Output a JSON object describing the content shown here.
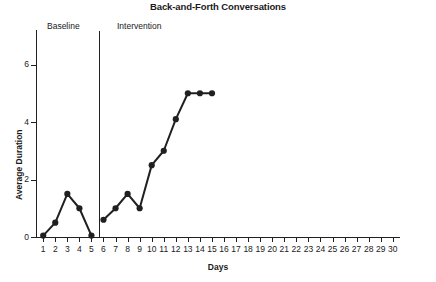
{
  "chart_data": {
    "type": "line",
    "title": "Back-and-Forth Conversations",
    "xlabel": "Days",
    "ylabel": "Average Duration",
    "xlim": [
      0.4,
      30.6
    ],
    "ylim": [
      0,
      7.2
    ],
    "x_ticks": [
      1,
      2,
      3,
      4,
      5,
      6,
      7,
      8,
      9,
      10,
      11,
      12,
      13,
      14,
      15,
      16,
      17,
      18,
      19,
      20,
      21,
      22,
      23,
      24,
      25,
      26,
      27,
      28,
      29,
      30
    ],
    "y_ticks": [
      0,
      2,
      4,
      6
    ],
    "grid": false,
    "legend": "none",
    "marker": "filled-circle",
    "line_color": "#202020",
    "series": [
      {
        "name": "Baseline",
        "x": [
          1,
          2,
          3,
          4,
          5
        ],
        "values": [
          0.05,
          0.5,
          1.5,
          1.0,
          0.05
        ]
      },
      {
        "name": "Intervention",
        "x": [
          6,
          7,
          8,
          9,
          10,
          11,
          12,
          13,
          14,
          15
        ],
        "values": [
          0.6,
          1.0,
          1.5,
          1.0,
          2.5,
          3.0,
          4.1,
          5.0,
          5.0,
          5.0
        ]
      }
    ],
    "annotations": [
      {
        "name": "phase-change-line",
        "type": "vline",
        "x": 5.5
      },
      {
        "name": "phase-label-baseline",
        "type": "text",
        "text": "Baseline"
      },
      {
        "name": "phase-label-intervention",
        "type": "text",
        "text": "Intervention"
      }
    ]
  },
  "labels": {
    "title": "Back-and-Forth Conversations",
    "y_axis_title": "Average Duration",
    "x_axis_title": "Days",
    "phase_baseline": "Baseline",
    "phase_intervention": "Intervention"
  }
}
